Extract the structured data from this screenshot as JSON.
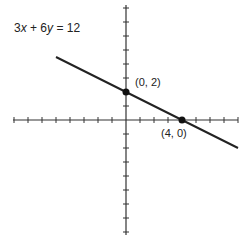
{
  "chart_data": {
    "type": "line",
    "title": "3x + 6y = 12",
    "equation": "3x + 6y = 12",
    "xlabel": "",
    "ylabel": "",
    "xlim": [
      -8,
      8
    ],
    "ylim": [
      -8,
      8
    ],
    "grid": false,
    "tick_step": 1,
    "tick_labels": false,
    "series": [
      {
        "name": "3x + 6y = 12",
        "x": [
          -5,
          8
        ],
        "y": [
          4.5,
          -2
        ]
      }
    ],
    "points": [
      {
        "x": 0,
        "y": 2,
        "label": "(0, 2)"
      },
      {
        "x": 4,
        "y": 0,
        "label": "(4, 0)"
      }
    ],
    "annotations": [
      "3x + 6y = 12",
      "(0, 2)",
      "(4, 0)"
    ]
  },
  "labels": {
    "equation_prefix": "3",
    "equation_x": "x",
    "equation_mid": " + 6",
    "equation_y": "y",
    "equation_suffix": " = 12",
    "point_a": "(0, 2)",
    "point_b": "(4, 0)"
  },
  "colors": {
    "ink": "#222222",
    "background": "#ffffff"
  }
}
